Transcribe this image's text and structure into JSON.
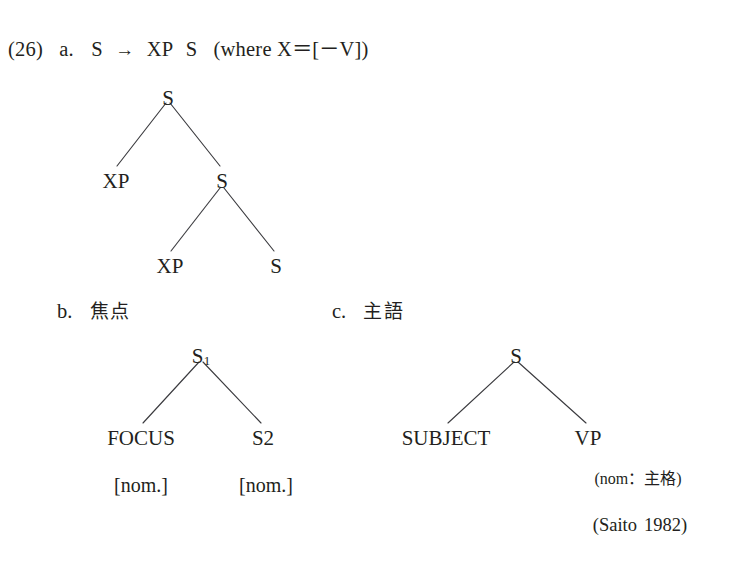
{
  "page": {
    "background": "#ffffff",
    "ink": "#231f20",
    "branch_color": "#3b3b3f"
  },
  "example": {
    "number": "(26)",
    "items": [
      {
        "letter": "a.",
        "rule": {
          "lhs": "S",
          "arrow": "→",
          "rhs": [
            "XP",
            "S"
          ],
          "condition": "(where X＝[－V])"
        }
      },
      {
        "letter": "b.",
        "caption": "焦点"
      },
      {
        "letter": "c.",
        "caption": "主語"
      }
    ]
  },
  "tree_a": {
    "nodes": {
      "root": "S",
      "left_child": "XP",
      "right_child": "S",
      "inner_left_child": "XP",
      "inner_right_child": "S"
    }
  },
  "tree_b": {
    "nodes": {
      "root": "S",
      "root_subscript": "1",
      "left_leaf": "FOCUS",
      "right_leaf": "S",
      "right_leaf_subscript": "2"
    },
    "features": {
      "left": "[nom.]",
      "right": "[nom.]"
    }
  },
  "tree_c": {
    "nodes": {
      "root": "S",
      "left_leaf": "SUBJECT",
      "right_leaf": "VP"
    },
    "note": "(nom：主格)"
  },
  "citation": {
    "author": "(Saito",
    "year": "1982)"
  }
}
